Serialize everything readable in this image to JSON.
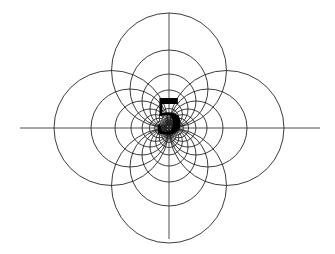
{
  "figure": {
    "type": "geometric-diagram",
    "canvas": {
      "width": 335,
      "height": 254,
      "background": "#ffffff"
    },
    "center": {
      "x": 169,
      "y": 128
    },
    "stroke": {
      "color": "#1a1a1a",
      "width": 0.85
    },
    "center_label": {
      "text": "5",
      "font_size_px": 54,
      "color": "#000000",
      "weight": "bold",
      "x": 169,
      "y": 128
    },
    "axes": {
      "horizontal": {
        "x1": 20,
        "y1": 128,
        "x2": 320,
        "y2": 128,
        "color": "#3a3a3a",
        "width": 0.9
      },
      "vertical": {
        "x1": 169,
        "y1": 13,
        "x2": 169,
        "y2": 239,
        "color": "#3a3a3a",
        "width": 0.9
      }
    },
    "circle_families": [
      {
        "name": "north-lobe",
        "direction": "up",
        "dx": 0,
        "dy": -1
      },
      {
        "name": "south-lobe",
        "direction": "down",
        "dx": 0,
        "dy": 1
      },
      {
        "name": "west-lobe",
        "direction": "left",
        "dx": -1,
        "dy": 0
      },
      {
        "name": "east-lobe",
        "direction": "right",
        "dx": 1,
        "dy": 0
      }
    ],
    "radii": [
      57.5,
      39.0,
      27.0,
      19.0,
      13.5,
      9.8,
      7.2,
      5.4,
      4.1,
      3.2,
      2.5
    ],
    "radius_ratio": 0.7,
    "circles_per_family": 11,
    "extents": {
      "leftmost_circle_edge_x": 54,
      "rightmost_circle_edge_x": 284,
      "topmost_circle_edge_y": 13,
      "bottommost_circle_edge_y": 243
    }
  }
}
